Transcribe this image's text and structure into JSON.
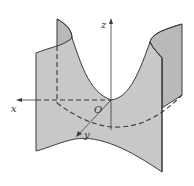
{
  "figure": {
    "type": "3d-surface-diagram",
    "colors": {
      "surface_fill": "#c8c8c8",
      "surface_back": "#b9b9b9",
      "stroke": "#3a3a3a",
      "background": "#ffffff"
    },
    "axes": {
      "x_label": "x",
      "y_label": "y",
      "z_label": "z",
      "origin_label": "O"
    }
  }
}
